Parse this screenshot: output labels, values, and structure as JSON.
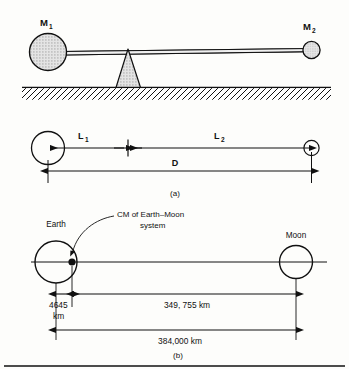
{
  "figure": {
    "panels": [
      {
        "id": "a",
        "caption": "(a)",
        "masses": [
          {
            "name": "M",
            "subscript": "1",
            "role": "large-mass"
          },
          {
            "name": "M",
            "subscript": "2",
            "role": "small-mass"
          }
        ],
        "dimensions": [
          {
            "name": "L",
            "subscript": "1",
            "label": "L"
          },
          {
            "name": "L",
            "subscript": "2",
            "label": "L"
          },
          {
            "name": "D",
            "subscript": "",
            "label": "D"
          }
        ],
        "elements": {
          "fulcrum": "fulcrum-triangle",
          "ground": "hatched-ground",
          "beam": "balance-beam"
        }
      },
      {
        "id": "b",
        "caption": "(b)",
        "bodies": [
          {
            "label": "Earth",
            "role": "earth-circle"
          },
          {
            "label": "Moon",
            "role": "moon-circle"
          }
        ],
        "callout": {
          "line1": "CM of Earth–Moon",
          "line2": "system"
        },
        "distances": [
          {
            "id": "earth-to-cm",
            "line1": "4645",
            "line2": "km",
            "value": "4645 km"
          },
          {
            "id": "cm-to-moon",
            "text": "349, 755 km"
          },
          {
            "id": "earth-to-moon",
            "text": "384,000 km"
          }
        ]
      }
    ],
    "colors": {
      "ink": "#111111",
      "paper": "#fdfdfb",
      "mass_fill": "#d8d8d8",
      "fulcrum_fill": "#dcdcdc"
    }
  }
}
